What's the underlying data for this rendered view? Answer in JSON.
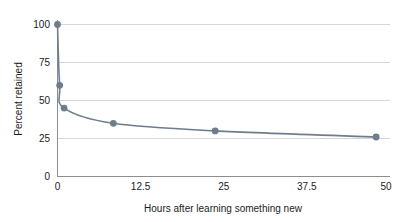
{
  "chart_data": {
    "type": "line",
    "title": "",
    "xlabel": "Hours after learning something new",
    "ylabel": "Percent retained",
    "xlim": [
      0,
      50
    ],
    "ylim": [
      0,
      100
    ],
    "xticks": [
      "0",
      "12.5",
      "25",
      "37.5",
      "50"
    ],
    "xtick_values": [
      0,
      12.5,
      25,
      37.5,
      50
    ],
    "yticks": [
      "0",
      "25",
      "50",
      "75",
      "100"
    ],
    "ytick_values": [
      0,
      25,
      50,
      75,
      100
    ],
    "grid": "horizontal",
    "legend": "none",
    "markers": "filled-circle",
    "series": [
      {
        "name": "Percent retained",
        "color": "#6e7d8b",
        "x": [
          0,
          0.33,
          1,
          8.5,
          24,
          48.5
        ],
        "values": [
          100,
          60,
          45,
          35,
          30,
          26
        ],
        "points": [
          {
            "x": 0,
            "y": 100
          },
          {
            "x": 0.33,
            "y": 60
          },
          {
            "x": 1,
            "y": 45
          },
          {
            "x": 8.5,
            "y": 35
          },
          {
            "x": 24,
            "y": 30
          },
          {
            "x": 48.5,
            "y": 26
          }
        ]
      }
    ]
  },
  "colors": {
    "series": "#6e7d8b",
    "grid": "#d6d6d6",
    "axis": "#8d8d8d",
    "text": "#1c1c1c",
    "background": "#ffffff"
  }
}
